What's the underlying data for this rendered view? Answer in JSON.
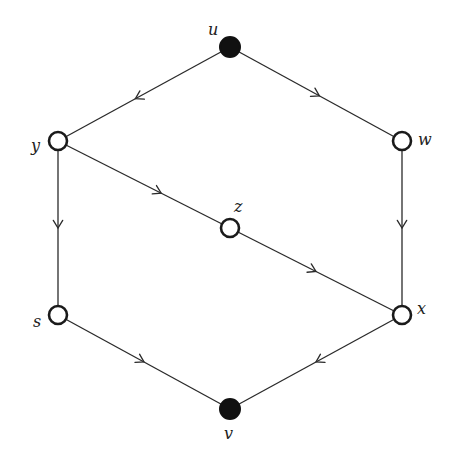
{
  "diagram": {
    "type": "directed-graph",
    "nodes": [
      {
        "id": "u",
        "label": "u",
        "x": 230,
        "y": 47,
        "filled": true,
        "label_dx": -22,
        "label_dy": -12
      },
      {
        "id": "w",
        "label": "w",
        "x": 402,
        "y": 141,
        "filled": false,
        "label_dx": 16,
        "label_dy": 4
      },
      {
        "id": "y",
        "label": "y",
        "x": 58,
        "y": 141,
        "filled": false,
        "label_dx": -27,
        "label_dy": 10
      },
      {
        "id": "z",
        "label": "z",
        "x": 230,
        "y": 228,
        "filled": false,
        "label_dx": 4,
        "label_dy": -16
      },
      {
        "id": "s",
        "label": "s",
        "x": 58,
        "y": 315,
        "filled": false,
        "label_dx": -25,
        "label_dy": 12
      },
      {
        "id": "x",
        "label": "x",
        "x": 402,
        "y": 315,
        "filled": false,
        "label_dx": 15,
        "label_dy": -1
      },
      {
        "id": "v",
        "label": "v",
        "x": 230,
        "y": 409,
        "filled": true,
        "label_dx": -6,
        "label_dy": 30
      }
    ],
    "edges": [
      {
        "from": "u",
        "to": "y",
        "arrow_t": 0.55
      },
      {
        "from": "u",
        "to": "w",
        "arrow_t": 0.52
      },
      {
        "from": "y",
        "to": "z",
        "arrow_t": 0.6
      },
      {
        "from": "z",
        "to": "x",
        "arrow_t": 0.5
      },
      {
        "from": "y",
        "to": "s",
        "arrow_t": 0.5
      },
      {
        "from": "w",
        "to": "x",
        "arrow_t": 0.5
      },
      {
        "from": "s",
        "to": "v",
        "arrow_t": 0.5
      },
      {
        "from": "x",
        "to": "v",
        "arrow_t": 0.5
      }
    ],
    "colors": {
      "stroke": "#2a2a2a",
      "filled_node": "#111111",
      "open_node_fill": "#ffffff"
    }
  }
}
